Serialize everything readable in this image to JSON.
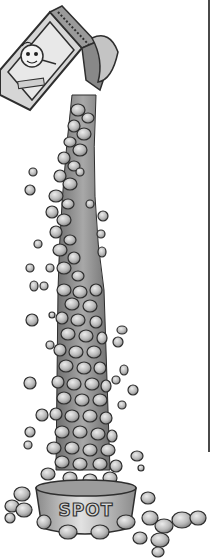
{
  "illustration": {
    "subject": "Pet food bag pouring a tall column of kibble into a dog bowl",
    "style": "grayscale pencil/ink cartoon",
    "bowl": {
      "label": "SPOT"
    },
    "bag": {
      "mascot": "cartoon dog face on bag label"
    },
    "colors": {
      "background": "#ffffff",
      "kibble_fill": "#b8b8b8",
      "kibble_highlight": "#e6e6e6",
      "outline": "#2e2e2e",
      "bag_fill": "#cfcfcf",
      "bowl_fill": "#bdbdbd",
      "rule": "#4a4a4a"
    }
  }
}
